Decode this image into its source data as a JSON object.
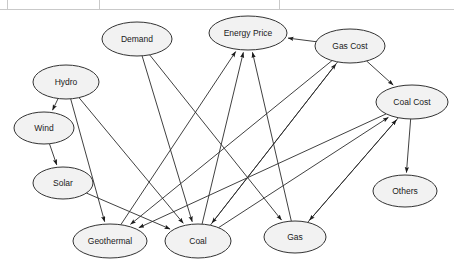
{
  "window": {
    "title": "Causal Graph",
    "chrome_visible": true
  },
  "style": {
    "node_fill": "#f2f2f2",
    "node_stroke": "#333333",
    "edge_color": "#2b2b2b",
    "background": "#ffffff",
    "label_color": "#1a1a1a"
  },
  "graph": {
    "type": "directed-acyclic-graph",
    "node_count": 10,
    "edge_count": 20,
    "nodes": [
      {
        "id": "demand",
        "label": "Demand",
        "cx": 137,
        "cy": 39,
        "rx": 35,
        "ry": 17
      },
      {
        "id": "energy_price",
        "label": "Energy Price",
        "cx": 248,
        "cy": 33,
        "rx": 39,
        "ry": 17
      },
      {
        "id": "gas_cost",
        "label": "Gas Cost",
        "cx": 350,
        "cy": 46,
        "rx": 35,
        "ry": 17
      },
      {
        "id": "coal_cost",
        "label": "Coal Cost",
        "cx": 412,
        "cy": 102,
        "rx": 36,
        "ry": 17
      },
      {
        "id": "hydro",
        "label": "Hydro",
        "cx": 66,
        "cy": 82,
        "rx": 33,
        "ry": 17
      },
      {
        "id": "wind",
        "label": "Wind",
        "cx": 44,
        "cy": 128,
        "rx": 30,
        "ry": 16
      },
      {
        "id": "solar",
        "label": "Solar",
        "cx": 63,
        "cy": 183,
        "rx": 30,
        "ry": 16
      },
      {
        "id": "others",
        "label": "Others",
        "cx": 405,
        "cy": 191,
        "rx": 32,
        "ry": 16
      },
      {
        "id": "geothermal",
        "label": "Geothermal",
        "cx": 110,
        "cy": 241,
        "rx": 37,
        "ry": 17
      },
      {
        "id": "coal",
        "label": "Coal",
        "cx": 198,
        "cy": 241,
        "rx": 33,
        "ry": 17
      },
      {
        "id": "gas",
        "label": "Gas",
        "cx": 295,
        "cy": 237,
        "rx": 31,
        "ry": 16
      }
    ],
    "edges": [
      {
        "from": "hydro",
        "to": "wind"
      },
      {
        "from": "wind",
        "to": "solar"
      },
      {
        "from": "hydro",
        "to": "geothermal"
      },
      {
        "from": "hydro",
        "to": "coal"
      },
      {
        "from": "solar",
        "to": "coal"
      },
      {
        "from": "demand",
        "to": "coal"
      },
      {
        "from": "demand",
        "to": "gas"
      },
      {
        "from": "coal",
        "to": "energy_price"
      },
      {
        "from": "coal",
        "to": "gas_cost"
      },
      {
        "from": "coal",
        "to": "coal_cost"
      },
      {
        "from": "gas_cost",
        "to": "energy_price"
      },
      {
        "from": "gas_cost",
        "to": "coal_cost"
      },
      {
        "from": "gas_cost",
        "to": "geothermal"
      },
      {
        "from": "gas_cost",
        "to": "coal"
      },
      {
        "from": "coal_cost",
        "to": "others"
      },
      {
        "from": "coal_cost",
        "to": "geothermal"
      },
      {
        "from": "coal_cost",
        "to": "gas"
      },
      {
        "from": "gas",
        "to": "energy_price"
      },
      {
        "from": "gas",
        "to": "coal_cost"
      },
      {
        "from": "geothermal",
        "to": "energy_price"
      }
    ]
  }
}
